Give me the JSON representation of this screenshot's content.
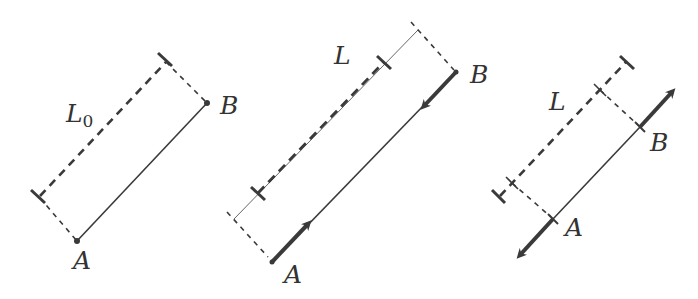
{
  "colors": {
    "stroke": "#3a3a3a",
    "background": "#ffffff"
  },
  "figures": [
    {
      "id": "rest",
      "length_label": "L",
      "length_subscript": "0",
      "point_a": "A",
      "point_b": "B",
      "description": "Rod AB at rest with natural length L0 (dashed bracket)"
    },
    {
      "id": "compressed",
      "length_label": "L",
      "point_a": "A",
      "point_b": "B",
      "description": "Rod AB with inward forces at both ends; shorter length L indicated"
    },
    {
      "id": "stretched",
      "length_label": "L",
      "point_a": "A",
      "point_b": "B",
      "description": "Rod AB with outward forces at both ends; length L indicated"
    }
  ]
}
